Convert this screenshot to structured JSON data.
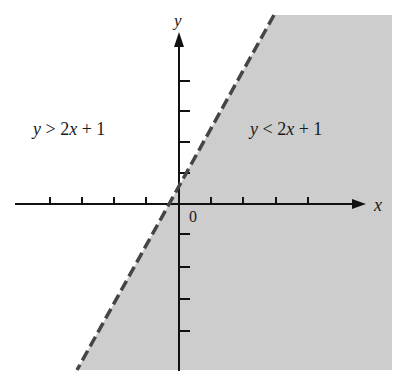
{
  "figure": {
    "type": "linear-inequality-graph",
    "boundary_equation": "y = 2x + 1",
    "boundary_style": "dashed",
    "shaded_region": "y < 2x + 1",
    "colors": {
      "shade": "#cdcdcd",
      "boundary": "#454545",
      "axes": "#111111",
      "text": "#1a1a1a"
    }
  },
  "axes": {
    "x_label": "x",
    "y_label": "y",
    "origin_label": "0",
    "x_ticks_left": 4,
    "x_ticks_right": 4,
    "y_ticks_up": 4,
    "y_ticks_down": 4
  },
  "regions": {
    "above_label": "y > 2x + 1",
    "below_label": "y < 2x + 1"
  }
}
